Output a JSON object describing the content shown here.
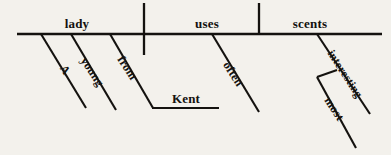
{
  "diagram": {
    "type": "reed-kellogg-sentence-diagram",
    "sentence": "A young lady from Kent often uses most interesting scents",
    "background_color": "#f3f1ec",
    "ink_color": "#14120f",
    "baseline": {
      "label": "main-horizontal-line",
      "x1": 17,
      "y": 34,
      "x2": 382
    },
    "dividers": [
      {
        "name": "subject-predicate-divider",
        "x": 144,
        "y_top": 3,
        "y_bottom": 55
      },
      {
        "name": "predicate-object-divider",
        "x": 259,
        "y_top": 3,
        "y_bottom": 34
      }
    ],
    "baseline_words": [
      {
        "id": "subject",
        "text": "lady",
        "role": "subject",
        "x": 77,
        "y": 28
      },
      {
        "id": "verb",
        "text": "uses",
        "role": "verb",
        "x": 207,
        "y": 28
      },
      {
        "id": "object",
        "text": "scents",
        "role": "direct-object",
        "x": 310,
        "y": 28
      }
    ],
    "modifiers": [
      {
        "id": "article-a",
        "text": "A",
        "role": "article-modifying-subject",
        "attaches_to": "subject",
        "line": {
          "x1": 41,
          "y1": 34,
          "x2": 86,
          "y2": 108
        },
        "label_x": 62,
        "label_y": 72,
        "rotation": -57
      },
      {
        "id": "adjective-young",
        "text": "young",
        "role": "adjective-modifying-subject",
        "attaches_to": "subject",
        "line": {
          "x1": 71,
          "y1": 34,
          "x2": 116,
          "y2": 110
        },
        "label_x": 89,
        "label_y": 74,
        "rotation": -57
      },
      {
        "id": "preposition-from",
        "text": "from",
        "role": "preposition-modifying-subject",
        "attaches_to": "subject",
        "line": {
          "x1": 110,
          "y1": 34,
          "x2": 153,
          "y2": 108
        },
        "label_x": 124,
        "label_y": 70,
        "rotation": -57
      },
      {
        "id": "adverb-often",
        "text": "often",
        "role": "adverb-modifying-verb",
        "attaches_to": "verb",
        "line": {
          "x1": 212,
          "y1": 34,
          "x2": 259,
          "y2": 112
        },
        "label_x": 230,
        "label_y": 76,
        "rotation": -57
      },
      {
        "id": "adjective-interesting",
        "text": "interesting",
        "role": "adjective-modifying-object",
        "attaches_to": "object",
        "line": {
          "x1": 317,
          "y1": 34,
          "x2": 370,
          "y2": 114
        },
        "label_x": 342,
        "label_y": 76,
        "rotation": -57
      },
      {
        "id": "adverb-most",
        "text": "most",
        "role": "adverb-modifying-interesting",
        "attaches_to": "adjective-interesting",
        "line": {
          "x1": 317,
          "y1": 77,
          "x2": 356,
          "y2": 148
        },
        "label_x": 331,
        "label_y": 111,
        "rotation": -57
      }
    ],
    "prepositional_object": {
      "id": "object-of-preposition-kent",
      "text": "Kent",
      "role": "object-of-preposition",
      "line": {
        "x1": 152,
        "y": 108,
        "x2": 219
      },
      "label_x": 186,
      "label_y": 103
    },
    "connectors": [
      {
        "id": "most-to-interesting-connector",
        "role": "adverb-attachment-bracket",
        "x1": 337,
        "y1": 70,
        "x2": 317,
        "y2": 77
      }
    ]
  }
}
